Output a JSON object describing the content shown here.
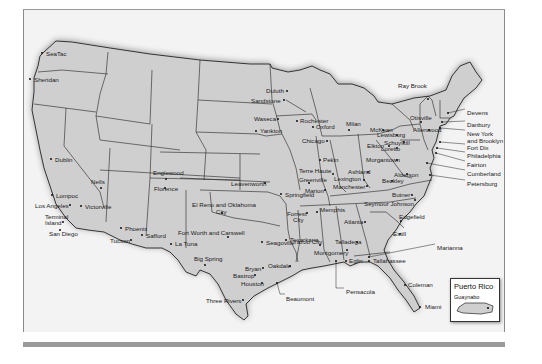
{
  "map": {
    "title": "Federal Prison Locations (United States)",
    "colors": {
      "land": "#cfcfcf",
      "border": "#222222",
      "background": "#f3f3f3",
      "frame_bar": "#9a9a9a"
    },
    "facilities": [
      {
        "name": "SeaTac",
        "x": 42,
        "y": 53,
        "dx": 4,
        "dy": -3
      },
      {
        "name": "Sheridan",
        "x": 30,
        "y": 79,
        "dx": 4,
        "dy": -3
      },
      {
        "name": "Dublin",
        "x": 51,
        "y": 159,
        "dx": 4,
        "dy": -3
      },
      {
        "name": "Nells",
        "x": 101,
        "y": 188,
        "dx": -10,
        "dy": -10
      },
      {
        "name": "Lompoc",
        "x": 52,
        "y": 195,
        "dx": 4,
        "dy": -3
      },
      {
        "name": "Los Angeles",
        "x": 70,
        "y": 205,
        "dx": -35,
        "dy": -3
      },
      {
        "name": "Victorville",
        "x": 81,
        "y": 206,
        "dx": 4,
        "dy": -3
      },
      {
        "name": "Terminal",
        "x": 63,
        "y": 222,
        "dx": -18,
        "dy": -9
      },
      {
        "name": "Island",
        "x": 63,
        "y": 222,
        "dx": -18,
        "dy": -3
      },
      {
        "name": "San Diego",
        "x": 60,
        "y": 230,
        "dx": -11,
        "dy": 0
      },
      {
        "name": "Phoenix",
        "x": 121,
        "y": 228,
        "dx": 4,
        "dy": -3
      },
      {
        "name": "Safford",
        "x": 142,
        "y": 235,
        "dx": 4,
        "dy": -3
      },
      {
        "name": "Tucson",
        "x": 131,
        "y": 240,
        "dx": -21,
        "dy": -3
      },
      {
        "name": "La Tuna",
        "x": 171,
        "y": 244,
        "dx": 4,
        "dy": -4
      },
      {
        "name": "Englewood",
        "x": 166,
        "y": 179,
        "dx": -13,
        "dy": -10
      },
      {
        "name": "Florence",
        "x": 165,
        "y": 188,
        "dx": -11,
        "dy": -3
      },
      {
        "name": "Leavenworth",
        "x": 265,
        "y": 183,
        "dx": -34,
        "dy": -3
      },
      {
        "name": "El Reno and Oklahoma",
        "x": 222,
        "y": 213,
        "dx": -30,
        "dy": -12
      },
      {
        "name": "City",
        "x": 222,
        "y": 213,
        "dx": -6,
        "dy": -5
      },
      {
        "name": "Fort Worth and Carswell",
        "x": 228,
        "y": 237,
        "dx": -50,
        "dy": -8
      },
      {
        "name": "Seagoville",
        "x": 262,
        "y": 242,
        "dx": 4,
        "dy": -3
      },
      {
        "name": "Big Spring",
        "x": 205,
        "y": 265,
        "dx": -11,
        "dy": -10
      },
      {
        "name": "Bryan",
        "x": 263,
        "y": 268,
        "dx": -18,
        "dy": -3
      },
      {
        "name": "Bastrop",
        "x": 255,
        "y": 275,
        "dx": -22,
        "dy": -3
      },
      {
        "name": "Houston",
        "x": 262,
        "y": 283,
        "dx": -21,
        "dy": -3
      },
      {
        "name": "Oakdale",
        "x": 290,
        "y": 266,
        "dx": -22,
        "dy": -4
      },
      {
        "name": "Beaumont",
        "x": 277,
        "y": 283,
        "dx": 9,
        "dy": 12
      },
      {
        "name": "Three Rivers",
        "x": 243,
        "y": 300,
        "dx": -37,
        "dy": -3
      },
      {
        "name": "Springfield",
        "x": 281,
        "y": 194,
        "dx": 4,
        "dy": -3
      },
      {
        "name": "Forrest",
        "x": 307,
        "y": 213,
        "dx": -20,
        "dy": -3
      },
      {
        "name": "City",
        "x": 307,
        "y": 213,
        "dx": -14,
        "dy": 3
      },
      {
        "name": "Texarkana",
        "x": 286,
        "y": 240,
        "dx": 4,
        "dy": -4
      },
      {
        "name": "Yazoo City",
        "x": 320,
        "y": 245,
        "dx": -27,
        "dy": -7
      },
      {
        "name": "Memphis",
        "x": 317,
        "y": 212,
        "dx": 3,
        "dy": -6
      },
      {
        "name": "Talladega",
        "x": 357,
        "y": 242,
        "dx": -22,
        "dy": -4
      },
      {
        "name": "Montgomery",
        "x": 347,
        "y": 250,
        "dx": -33,
        "dy": -1
      },
      {
        "name": "Atlanta",
        "x": 365,
        "y": 222,
        "dx": -21,
        "dy": -4
      },
      {
        "name": "Edgefield",
        "x": 401,
        "y": 221,
        "dx": -2,
        "dy": -8
      },
      {
        "name": "Estill",
        "x": 400,
        "y": 234,
        "dx": -7,
        "dy": -4
      },
      {
        "name": "Marianna",
        "x": 369,
        "y": 257,
        "dx": 68,
        "dy": -13
      },
      {
        "name": "Eglin",
        "x": 346,
        "y": 261,
        "dx": 3,
        "dy": -4
      },
      {
        "name": "Tallahassee",
        "x": 369,
        "y": 261,
        "dx": 4,
        "dy": -4
      },
      {
        "name": "Pensacola",
        "x": 336,
        "y": 261,
        "dx": 10,
        "dy": 27
      },
      {
        "name": "Coleman",
        "x": 405,
        "y": 285,
        "dx": 3,
        "dy": -4
      },
      {
        "name": "Miami",
        "x": 420,
        "y": 307,
        "dx": 5,
        "dy": -4
      },
      {
        "name": "Duluth",
        "x": 287,
        "y": 91,
        "dx": -21,
        "dy": -4
      },
      {
        "name": "Sandstone",
        "x": 284,
        "y": 100,
        "dx": -33,
        "dy": -3
      },
      {
        "name": "Waseca",
        "x": 278,
        "y": 119,
        "dx": -24,
        "dy": -4
      },
      {
        "name": "Yankton",
        "x": 256,
        "y": 131,
        "dx": 4,
        "dy": -4
      },
      {
        "name": "Rochester",
        "x": 297,
        "y": 121,
        "dx": 3,
        "dy": -4
      },
      {
        "name": "Oxford",
        "x": 313,
        "y": 127,
        "dx": 3,
        "dy": -4
      },
      {
        "name": "Milan",
        "x": 349,
        "y": 130,
        "dx": -3,
        "dy": -10
      },
      {
        "name": "Chicago",
        "x": 327,
        "y": 141,
        "dx": -25,
        "dy": -4
      },
      {
        "name": "Pekin",
        "x": 320,
        "y": 160,
        "dx": 3,
        "dy": -4
      },
      {
        "name": "Terre Haute",
        "x": 333,
        "y": 174,
        "dx": -34,
        "dy": -7
      },
      {
        "name": "Greenville",
        "x": 309,
        "y": 183,
        "dx": -10,
        "dy": -7
      },
      {
        "name": "Marion",
        "x": 325,
        "y": 190,
        "dx": -20,
        "dy": -3
      },
      {
        "name": "Ashland",
        "x": 368,
        "y": 172,
        "dx": -20,
        "dy": -4
      },
      {
        "name": "Lexington",
        "x": 364,
        "y": 180,
        "dx": -30,
        "dy": -5
      },
      {
        "name": "Manchester",
        "x": 367,
        "y": 186,
        "dx": -34,
        "dy": -3
      },
      {
        "name": "Elkton",
        "x": 389,
        "y": 146,
        "dx": -22,
        "dy": -4
      },
      {
        "name": "McKean",
        "x": 383,
        "y": 130,
        "dx": -13,
        "dy": -4
      },
      {
        "name": "Lewisburg",
        "x": 397,
        "y": 135,
        "dx": -20,
        "dy": -4
      },
      {
        "name": "Schuylkill",
        "x": 404,
        "y": 142,
        "dx": -20,
        "dy": -3
      },
      {
        "name": "Loretto",
        "x": 397,
        "y": 148,
        "dx": -16,
        "dy": -3
      },
      {
        "name": "Morgantown",
        "x": 397,
        "y": 160,
        "dx": -31,
        "dy": -4
      },
      {
        "name": "Alderson",
        "x": 407,
        "y": 174,
        "dx": -13,
        "dy": -3
      },
      {
        "name": "Beckley",
        "x": 392,
        "y": 181,
        "dx": -10,
        "dy": -4
      },
      {
        "name": "Butner",
        "x": 412,
        "y": 195,
        "dx": -20,
        "dy": -4
      },
      {
        "name": "Seymour Johnson",
        "x": 415,
        "y": 200,
        "dx": -51,
        "dy": 0
      },
      {
        "name": "Otisville",
        "x": 421,
        "y": 122,
        "dx": -11,
        "dy": -8
      },
      {
        "name": "Allenwood",
        "x": 429,
        "y": 130,
        "dx": -16,
        "dy": -4
      },
      {
        "name": "Ray Brook",
        "x": 428,
        "y": 99,
        "dx": -30,
        "dy": -17
      },
      {
        "name": "Devens",
        "x": 448,
        "y": 113,
        "dx": 19,
        "dy": -4
      },
      {
        "name": "Danbury",
        "x": 442,
        "y": 122,
        "dx": 25,
        "dy": -1
      },
      {
        "name": "New York",
        "x": 440,
        "y": 128,
        "dx": 27,
        "dy": 2
      },
      {
        "name": "and Brooklyn",
        "x": 440,
        "y": 128,
        "dx": 27,
        "dy": 9
      },
      {
        "name": "Fort Dix",
        "x": 440,
        "y": 142,
        "dx": 27,
        "dy": 2
      },
      {
        "name": "Philadelphia",
        "x": 437,
        "y": 148,
        "dx": 30,
        "dy": 4
      },
      {
        "name": "Fairton",
        "x": 436,
        "y": 153,
        "dx": 31,
        "dy": 8
      },
      {
        "name": "Cumberland",
        "x": 427,
        "y": 163,
        "dx": 40,
        "dy": 7
      },
      {
        "name": "Petersburg",
        "x": 430,
        "y": 175,
        "dx": 37,
        "dy": 5
      }
    ],
    "inset": {
      "title": "Puerto Rico",
      "city": "Guaynabo"
    }
  }
}
